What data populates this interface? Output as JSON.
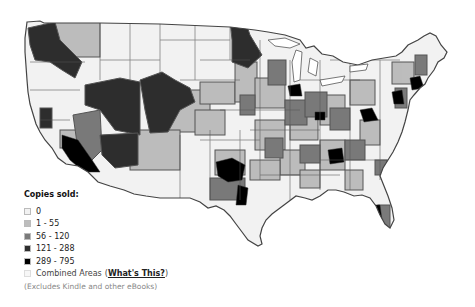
{
  "legend": {
    "title": "Copies sold:",
    "items": [
      {
        "label": "0",
        "color": "#f2f2f2"
      },
      {
        "label": "1 - 55",
        "color": "#bdbdbd"
      },
      {
        "label": "56 - 120",
        "color": "#7a7a7a"
      },
      {
        "label": "121 - 288",
        "color": "#2e2e2e"
      },
      {
        "label": "289 - 795",
        "color": "#000000"
      }
    ],
    "combined_areas_label": "Combined Areas",
    "combined_areas_open": "(",
    "whats_this_link": "What's This?",
    "combined_areas_close": ")",
    "combined_areas_color": "#f7f7f7",
    "footnote": "(Excludes Kindle and other eBooks)"
  },
  "map": {
    "region": "Continental United States",
    "border_color": "#555555"
  }
}
